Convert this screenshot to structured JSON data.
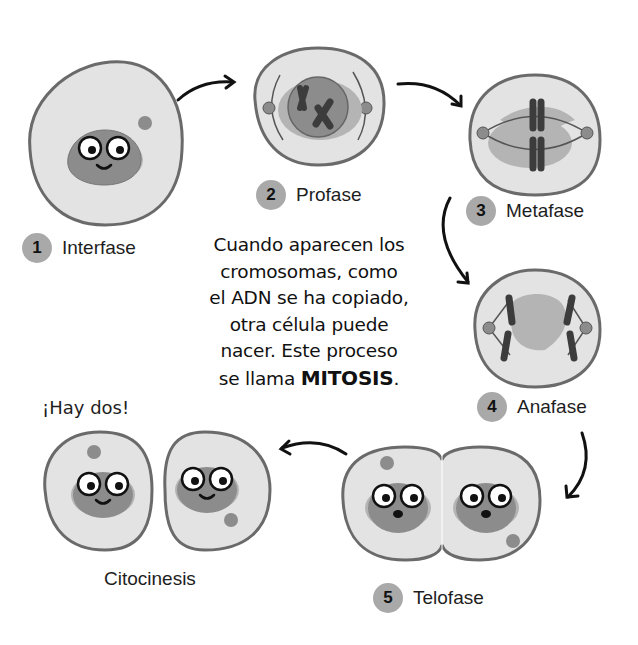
{
  "diagram": {
    "caption": {
      "lines": [
        "Cuando aparecen los",
        "cromosomas, como",
        "el ADN se ha copiado,",
        "otra célula puede",
        "nacer. Este proceso"
      ],
      "last_line_prefix": "se llama ",
      "emphasis": "MITOSIS",
      "last_line_suffix": "."
    },
    "stages": [
      {
        "number": "1",
        "name": "Interfase"
      },
      {
        "number": "2",
        "name": "Profase"
      },
      {
        "number": "3",
        "name": "Metafase"
      },
      {
        "number": "4",
        "name": "Anafase"
      },
      {
        "number": "5",
        "name": "Telofase"
      }
    ],
    "final_stage": {
      "name": "Citocinesis",
      "exclamation": "¡Hay dos!"
    },
    "colors": {
      "cell_fill": "#e3e3e3",
      "cell_outline": "#6a6a6a",
      "nucleus": "#8c8c8c",
      "halo": "#b4b4b4",
      "chromosome": "#3c3c3c",
      "badge": "#a9a9a9",
      "arrow": "#111111"
    }
  }
}
